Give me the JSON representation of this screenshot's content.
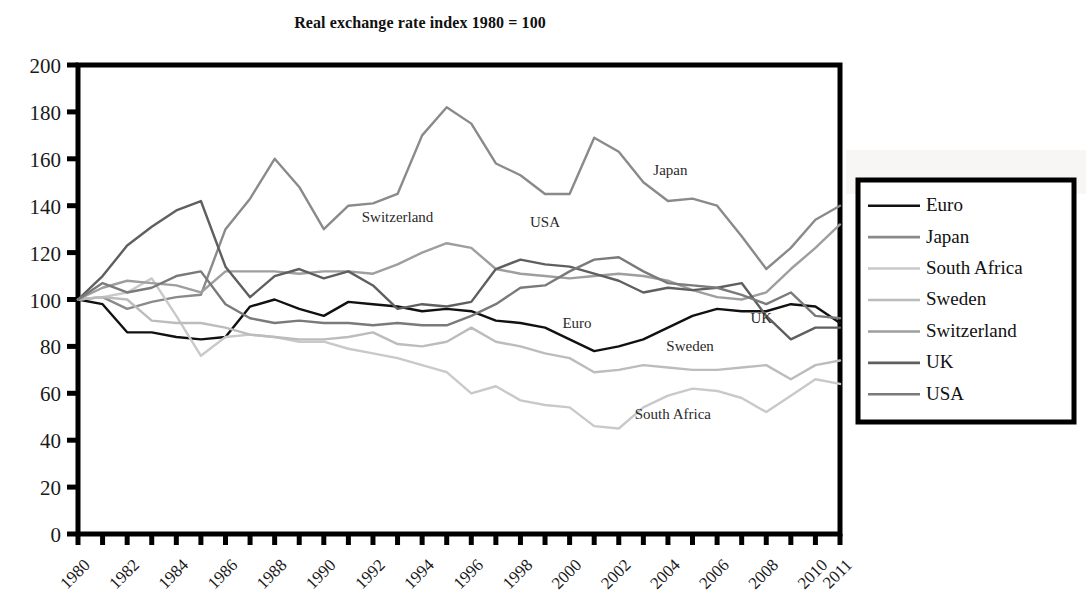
{
  "chart_data": {
    "type": "line",
    "title": "Real exchange rate index 1980 = 100",
    "xlabel": "",
    "ylabel": "",
    "xlim": [
      1980,
      2011
    ],
    "ylim": [
      0,
      200
    ],
    "ytick_labels": [
      "200",
      "180",
      "160",
      "140",
      "120",
      "100",
      "80",
      "60",
      "40",
      "20",
      "0"
    ],
    "ytick_values": [
      200,
      180,
      160,
      140,
      120,
      100,
      80,
      60,
      40,
      20,
      0
    ],
    "xtick_labels": [
      "1980",
      "1982",
      "1984",
      "1986",
      "1988",
      "1990",
      "1992",
      "1994",
      "1996",
      "1998",
      "2000",
      "2002",
      "2004",
      "2006",
      "2008",
      "2010",
      "2011"
    ],
    "xtick_values": [
      1980,
      1982,
      1984,
      1986,
      1988,
      1990,
      1992,
      1994,
      1996,
      1998,
      2000,
      2002,
      2004,
      2006,
      2008,
      2010,
      2011
    ],
    "x": [
      1980,
      1981,
      1982,
      1983,
      1984,
      1985,
      1986,
      1987,
      1988,
      1989,
      1990,
      1991,
      1992,
      1993,
      1994,
      1995,
      1996,
      1997,
      1998,
      1999,
      2000,
      2001,
      2002,
      2003,
      2004,
      2005,
      2006,
      2007,
      2008,
      2009,
      2010,
      2011
    ],
    "grid": false,
    "legend_position": "right-outside",
    "series": [
      {
        "name": "Euro",
        "color": "#111111",
        "values": [
          100,
          98,
          86,
          86,
          84,
          83,
          84,
          97,
          100,
          96,
          93,
          99,
          98,
          97,
          95,
          96,
          95,
          91,
          90,
          88,
          83,
          78,
          80,
          83,
          88,
          93,
          96,
          95,
          95,
          98,
          97,
          90
        ]
      },
      {
        "name": "Japan",
        "color": "#8a8a8a",
        "values": [
          100,
          101,
          96,
          99,
          101,
          102,
          130,
          143,
          160,
          148,
          130,
          140,
          141,
          145,
          170,
          182,
          175,
          158,
          153,
          145,
          145,
          169,
          163,
          150,
          142,
          143,
          140,
          127,
          113,
          122,
          134,
          140
        ]
      },
      {
        "name": "South Africa",
        "color": "#c9c9c9",
        "values": [
          100,
          101,
          103,
          109,
          93,
          76,
          84,
          85,
          84,
          82,
          82,
          79,
          77,
          75,
          72,
          69,
          60,
          63,
          57,
          55,
          54,
          46,
          45,
          54,
          59,
          62,
          61,
          58,
          52,
          59,
          66,
          64
        ]
      },
      {
        "name": "Sweden",
        "color": "#bcbcbc",
        "values": [
          100,
          101,
          100,
          91,
          90,
          90,
          88,
          85,
          84,
          83,
          83,
          84,
          86,
          81,
          80,
          82,
          88,
          82,
          80,
          77,
          75,
          69,
          70,
          72,
          71,
          70,
          70,
          71,
          72,
          66,
          72,
          74
        ]
      },
      {
        "name": "Switzerland",
        "color": "#9e9e9e",
        "values": [
          100,
          105,
          108,
          107,
          106,
          103,
          112,
          112,
          112,
          111,
          112,
          112,
          111,
          115,
          120,
          124,
          122,
          113,
          111,
          110,
          109,
          110,
          111,
          110,
          108,
          104,
          101,
          100,
          103,
          113,
          122,
          132
        ]
      },
      {
        "name": "UK",
        "color": "#5f5f5f",
        "values": [
          100,
          110,
          123,
          131,
          138,
          142,
          114,
          101,
          110,
          113,
          109,
          112,
          106,
          96,
          98,
          97,
          99,
          113,
          117,
          115,
          114,
          111,
          108,
          103,
          105,
          104,
          105,
          107,
          93,
          83,
          88,
          88
        ]
      },
      {
        "name": "USA",
        "color": "#7a7a7a",
        "values": [
          100,
          107,
          103,
          105,
          110,
          112,
          98,
          92,
          90,
          91,
          90,
          90,
          89,
          90,
          89,
          89,
          93,
          98,
          105,
          106,
          112,
          117,
          118,
          112,
          107,
          106,
          105,
          102,
          98,
          103,
          93,
          92
        ]
      }
    ],
    "annotations": [
      {
        "text": "Japan",
        "x": 2004.1,
        "y": 153
      },
      {
        "text": "Switzerland",
        "x": 1993.0,
        "y": 133
      },
      {
        "text": "USA",
        "x": 1999.0,
        "y": 131
      },
      {
        "text": "Euro",
        "x": 2000.3,
        "y": 88
      },
      {
        "text": "UK",
        "x": 2007.8,
        "y": 90
      },
      {
        "text": "Sweden",
        "x": 2004.9,
        "y": 78
      },
      {
        "text": "South Africa",
        "x": 2004.2,
        "y": 49
      }
    ],
    "legend_entries": [
      {
        "label": "Euro",
        "color": "#111111"
      },
      {
        "label": "Japan",
        "color": "#8a8a8a"
      },
      {
        "label": "South Africa",
        "color": "#c9c9c9"
      },
      {
        "label": "Sweden",
        "color": "#bcbcbc"
      },
      {
        "label": "Switzerland",
        "color": "#9e9e9e"
      },
      {
        "label": "UK",
        "color": "#5f5f5f"
      },
      {
        "label": "USA",
        "color": "#7a7a7a"
      }
    ]
  }
}
